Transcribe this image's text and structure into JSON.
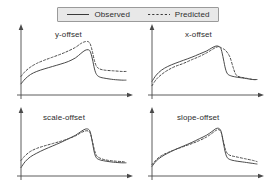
{
  "figure": {
    "width": 276,
    "height": 194,
    "background": "#ffffff",
    "line_color": "#4a4a4a",
    "legend_background": "#e8e8e8",
    "legend_border": "#9a9a9a"
  },
  "legend": {
    "entries": [
      {
        "label": "Observed",
        "style": "solid",
        "sample_name": "solid-line-sample"
      },
      {
        "label": "Predicted",
        "style": "dotted",
        "sample_name": "dotted-line-sample"
      }
    ]
  },
  "chart_data": {
    "type": "line",
    "title": "",
    "xlabel": "",
    "ylabel": "",
    "grid": false,
    "legend_position": "top-center",
    "axis_style": "arrow-axes-no-ticks",
    "xlim": [
      0,
      100
    ],
    "ylim": [
      0,
      100
    ],
    "series_names": [
      "Observed",
      "Predicted"
    ],
    "panels": [
      {
        "title": "y-offset",
        "series": [
          {
            "name": "Observed",
            "style": "solid",
            "x": [
              0,
              4,
              9,
              15,
              22,
              30,
              38,
              45,
              52,
              57,
              61,
              64,
              66,
              68,
              70,
              72,
              75,
              80,
              88,
              96,
              100
            ],
            "y": [
              18,
              26,
              33,
              38,
              42,
              46,
              50,
              54,
              60,
              67,
              72,
              73,
              70,
              58,
              42,
              33,
              29,
              27,
              25,
              24,
              24
            ]
          },
          {
            "name": "Predicted",
            "style": "dotted",
            "x": [
              0,
              4,
              9,
              15,
              22,
              30,
              38,
              45,
              52,
              57,
              61,
              64,
              66,
              68,
              70,
              72,
              75,
              80,
              88,
              96,
              100
            ],
            "y": [
              30,
              38,
              45,
              51,
              56,
              61,
              66,
              71,
              77,
              83,
              86,
              86,
              82,
              70,
              55,
              46,
              42,
              40,
              39,
              38,
              38
            ]
          }
        ]
      },
      {
        "title": "x-offset",
        "series": [
          {
            "name": "Observed",
            "style": "solid",
            "x": [
              0,
              4,
              9,
              15,
              22,
              30,
              38,
              45,
              52,
              57,
              61,
              64,
              66,
              68,
              70,
              72,
              75,
              80,
              88,
              96,
              100
            ],
            "y": [
              22,
              32,
              40,
              46,
              51,
              56,
              61,
              66,
              71,
              76,
              79,
              78,
              73,
              58,
              42,
              34,
              31,
              29,
              27,
              25,
              25
            ]
          },
          {
            "name": "Predicted",
            "style": "dotted",
            "x": [
              0,
              4,
              9,
              15,
              22,
              30,
              38,
              45,
              52,
              57,
              61,
              64,
              66,
              70,
              74,
              77,
              79,
              81,
              84,
              90,
              96,
              100
            ],
            "y": [
              15,
              25,
              33,
              40,
              46,
              51,
              57,
              62,
              68,
              73,
              77,
              78,
              76,
              72,
              62,
              46,
              36,
              31,
              29,
              27,
              25,
              25
            ]
          }
        ]
      },
      {
        "title": "scale-offset",
        "series": [
          {
            "name": "Observed",
            "style": "solid",
            "x": [
              0,
              4,
              9,
              15,
              22,
              30,
              38,
              45,
              52,
              57,
              61,
              64,
              66,
              68,
              70,
              72,
              75,
              80,
              88,
              96,
              100
            ],
            "y": [
              14,
              24,
              32,
              38,
              44,
              50,
              56,
              62,
              68,
              74,
              78,
              78,
              73,
              56,
              38,
              30,
              27,
              25,
              23,
              22,
              22
            ]
          },
          {
            "name": "Predicted",
            "style": "dotted",
            "x": [
              0,
              4,
              9,
              15,
              22,
              30,
              38,
              45,
              52,
              57,
              61,
              64,
              66,
              68,
              70,
              72,
              75,
              80,
              88,
              96,
              100
            ],
            "y": [
              26,
              34,
              41,
              46,
              50,
              54,
              58,
              62,
              67,
              72,
              75,
              75,
              71,
              58,
              43,
              34,
              30,
              27,
              25,
              24,
              23
            ]
          }
        ]
      },
      {
        "title": "slope-offset",
        "series": [
          {
            "name": "Observed",
            "style": "solid",
            "x": [
              0,
              4,
              9,
              15,
              22,
              30,
              38,
              45,
              52,
              57,
              61,
              64,
              66,
              68,
              70,
              72,
              75,
              80,
              88,
              96,
              100
            ],
            "y": [
              16,
              25,
              32,
              38,
              44,
              50,
              56,
              62,
              68,
              74,
              79,
              79,
              73,
              55,
              38,
              30,
              27,
              25,
              23,
              21,
              20
            ]
          },
          {
            "name": "Predicted",
            "style": "dotted",
            "x": [
              0,
              4,
              9,
              15,
              22,
              30,
              38,
              45,
              52,
              57,
              61,
              64,
              66,
              68,
              70,
              72,
              75,
              80,
              88,
              96,
              100
            ],
            "y": [
              19,
              27,
              34,
              39,
              44,
              49,
              54,
              59,
              65,
              71,
              76,
              77,
              72,
              58,
              44,
              37,
              34,
              32,
              29,
              26,
              24
            ]
          }
        ]
      }
    ]
  }
}
